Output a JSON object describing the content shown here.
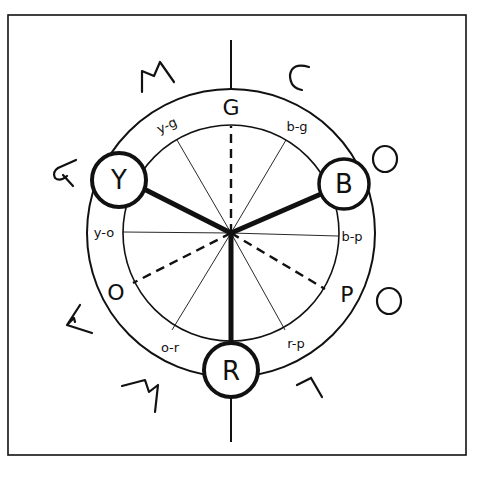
{
  "diagram": {
    "frame": {
      "x": 8,
      "y": 15,
      "w": 458,
      "h": 440
    },
    "center": {
      "x": 231,
      "y": 233
    },
    "inner_radius": 108,
    "outer_radius": 144,
    "colors": {
      "ink": "#111111",
      "background": "#ffffff"
    },
    "primaries": [
      {
        "id": "yellow",
        "label": "Y",
        "cx": 119,
        "cy": 180,
        "r": 27
      },
      {
        "id": "blue",
        "label": "B",
        "cx": 344,
        "cy": 184,
        "r": 25
      },
      {
        "id": "red",
        "label": "R",
        "cx": 231,
        "cy": 370,
        "r": 27
      }
    ],
    "secondaries": [
      {
        "id": "green",
        "label": "G",
        "x": 231,
        "y": 112
      },
      {
        "id": "orange",
        "label": "O",
        "x": 116,
        "y": 293
      },
      {
        "id": "purple",
        "label": "P",
        "x": 345,
        "y": 296
      }
    ],
    "tertiaries": [
      {
        "id": "yellow-green",
        "label": "y-g",
        "x": 167,
        "y": 129
      },
      {
        "id": "blue-green",
        "label": "b-g",
        "x": 296,
        "y": 131
      },
      {
        "id": "yellow-orange",
        "label": "y-o",
        "x": 101,
        "y": 237
      },
      {
        "id": "blue-purple",
        "label": "b-p",
        "x": 352,
        "y": 240
      },
      {
        "id": "orange-red",
        "label": "o-r",
        "x": 171,
        "y": 352
      },
      {
        "id": "red-purple",
        "label": "r-p",
        "x": 295,
        "y": 347
      }
    ],
    "outer_words": {
      "warm": {
        "word": "WARM",
        "letters": [
          "W",
          "A",
          "R",
          "M"
        ]
      },
      "cool": {
        "word": "COOL",
        "letters": [
          "C",
          "O",
          "O",
          "L"
        ]
      }
    }
  }
}
